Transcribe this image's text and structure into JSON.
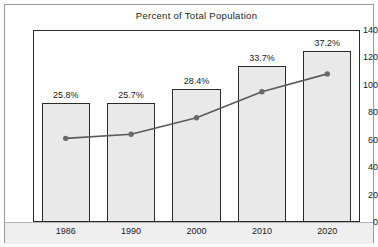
{
  "chart_data": {
    "type": "bar",
    "title": "Percent of Total Population",
    "xlabel": "",
    "ylabel": "",
    "categories": [
      "1986",
      "1990",
      "2000",
      "2010",
      "2020"
    ],
    "ylim": [
      0,
      140
    ],
    "yticks": [
      0,
      20,
      40,
      60,
      80,
      100,
      120,
      140
    ],
    "ytick_labels": [
      "0",
      "20",
      "40",
      "60",
      "80",
      "100",
      "120",
      "140"
    ],
    "grid": false,
    "legend": "none",
    "series": [
      {
        "name": "Population",
        "type": "bar",
        "values": [
          87,
          87,
          97,
          114,
          125
        ],
        "data_labels": [
          "25.8%",
          "25.7%",
          "28.4%",
          "33.7%",
          "37.2%"
        ],
        "fill_color": "#e9e9e9",
        "edge_color": "#2b2b2b"
      },
      {
        "name": "Percent of Total Population",
        "type": "line",
        "values": [
          61,
          64,
          76,
          95,
          108
        ],
        "line_color": "#5a5a5a",
        "marker_color": "#6a6a6a"
      }
    ]
  },
  "colors": {
    "background": "#ffffff",
    "frame": "#9a9a9a",
    "axis": "#2b2b2b",
    "bar_fill": "#e9e9e9",
    "line": "#5a5a5a",
    "xband": "#efefef",
    "text": "#1b1b1b"
  }
}
